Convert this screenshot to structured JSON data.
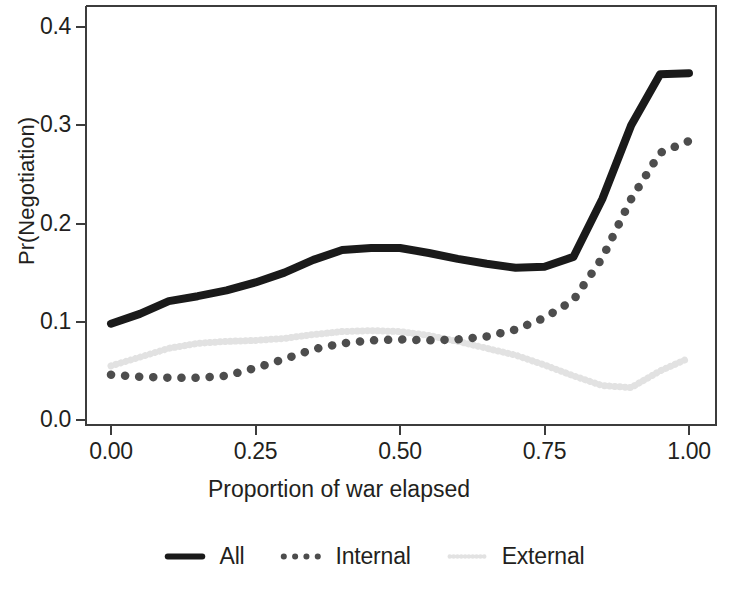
{
  "chart_data": {
    "type": "line",
    "title": "",
    "xlabel": "Proportion of war elapsed",
    "ylabel": "Pr(Negotiation)",
    "xlim": [
      0.0,
      1.0
    ],
    "ylim": [
      0.0,
      0.4
    ],
    "xticks": [
      "0.00",
      "0.25",
      "0.50",
      "0.75",
      "1.00"
    ],
    "xtick_values": [
      0.0,
      0.25,
      0.5,
      0.75,
      1.0
    ],
    "yticks": [
      "0.0",
      "0.1",
      "0.2",
      "0.3",
      "0.4"
    ],
    "ytick_values": [
      0.0,
      0.1,
      0.2,
      0.3,
      0.4
    ],
    "grid": false,
    "legend_position": "bottom",
    "x": [
      0.0,
      0.05,
      0.1,
      0.15,
      0.2,
      0.25,
      0.3,
      0.35,
      0.4,
      0.45,
      0.5,
      0.55,
      0.6,
      0.65,
      0.7,
      0.75,
      0.8,
      0.85,
      0.9,
      0.95,
      1.0
    ],
    "series": [
      {
        "name": "All",
        "style": "solid",
        "color": "#1a1a1a",
        "values": [
          0.098,
          0.108,
          0.121,
          0.126,
          0.132,
          0.14,
          0.15,
          0.163,
          0.173,
          0.175,
          0.175,
          0.17,
          0.164,
          0.159,
          0.155,
          0.156,
          0.166,
          0.225,
          0.3,
          0.352,
          0.353
        ]
      },
      {
        "name": "Internal",
        "style": "dotted",
        "color": "#4d4d4d",
        "values": [
          0.046,
          0.044,
          0.043,
          0.043,
          0.045,
          0.053,
          0.062,
          0.072,
          0.078,
          0.081,
          0.082,
          0.081,
          0.082,
          0.085,
          0.092,
          0.104,
          0.122,
          0.165,
          0.225,
          0.272,
          0.284
        ]
      },
      {
        "name": "External",
        "style": "dotted-light",
        "color": "#e2e2e2",
        "values": [
          0.055,
          0.064,
          0.073,
          0.078,
          0.08,
          0.081,
          0.083,
          0.087,
          0.09,
          0.091,
          0.09,
          0.086,
          0.08,
          0.073,
          0.066,
          0.056,
          0.045,
          0.035,
          0.033,
          0.05,
          0.063
        ]
      }
    ]
  },
  "legend": {
    "items": [
      {
        "label": "All",
        "key": "solid-line-key"
      },
      {
        "label": "Internal",
        "key": "dotted-line-key"
      },
      {
        "label": "External",
        "key": "light-dotted-line-key"
      }
    ]
  }
}
